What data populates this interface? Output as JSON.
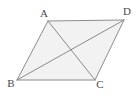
{
  "figure": {
    "kind": "geometry-diagram",
    "shape_name": "parallelogram",
    "canvas": {
      "width": 139,
      "height": 96
    },
    "colors": {
      "background": "#ffffff",
      "fill": "#f2f2f2",
      "stroke": "#8c8c8c",
      "diagonal_stroke": "#8a8a8a",
      "label": "#4a4a4a"
    },
    "stroke_width": 1,
    "vertices": [
      {
        "id": "A",
        "label": "A",
        "x": 48,
        "y": 21,
        "label_x": 44,
        "label_y": 17,
        "label_anchor": "middle"
      },
      {
        "id": "D",
        "label": "D",
        "x": 124,
        "y": 20,
        "label_x": 127,
        "label_y": 15,
        "label_anchor": "middle"
      },
      {
        "id": "C",
        "label": "C",
        "x": 95,
        "y": 80,
        "label_x": 100,
        "label_y": 88,
        "label_anchor": "middle"
      },
      {
        "id": "B",
        "label": "B",
        "x": 17,
        "y": 80,
        "label_x": 11,
        "label_y": 87,
        "label_anchor": "middle"
      }
    ],
    "polygon_order": [
      "A",
      "D",
      "C",
      "B"
    ],
    "polygon_points": "48,21 124,20 95,80 17,80",
    "edges": [
      {
        "id": "AD",
        "from": "A",
        "to": "D",
        "x1": 48,
        "y1": 21,
        "x2": 124,
        "y2": 20
      },
      {
        "id": "DC",
        "from": "D",
        "to": "C",
        "x1": 124,
        "y1": 20,
        "x2": 95,
        "y2": 80
      },
      {
        "id": "CB",
        "from": "C",
        "to": "B",
        "x1": 95,
        "y1": 80,
        "x2": 17,
        "y2": 80
      },
      {
        "id": "BA",
        "from": "B",
        "to": "A",
        "x1": 17,
        "y1": 80,
        "x2": 48,
        "y2": 21
      }
    ],
    "diagonals": [
      {
        "id": "AC",
        "from": "A",
        "to": "C",
        "x1": 48,
        "y1": 21,
        "x2": 95,
        "y2": 80
      },
      {
        "id": "BD",
        "from": "B",
        "to": "D",
        "x1": 17,
        "y1": 80,
        "x2": 124,
        "y2": 20
      }
    ],
    "intersection": {
      "id": "diagonal-intersection",
      "x": 68,
      "y": 52
    }
  }
}
